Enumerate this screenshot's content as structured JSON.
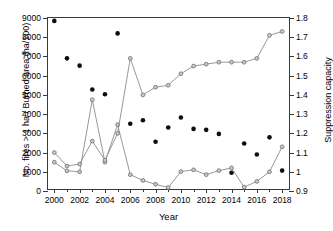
{
  "chart_data": {
    "type": "scatter",
    "title": "",
    "xlabel": "Year",
    "ylabel": "No. fires > 1 ha / Burned area (ha/100)",
    "ylabel_right": "Suppression capacity",
    "xlim": [
      1999.5,
      2018.7
    ],
    "ylim": [
      0,
      9000
    ],
    "ylim_right": [
      0.9,
      1.8
    ],
    "grid": false,
    "legend": "none",
    "x": [
      2000,
      2001,
      2002,
      2003,
      2004,
      2005,
      2006,
      2007,
      2008,
      2009,
      2010,
      2011,
      2012,
      2013,
      2014,
      2015,
      2016,
      2017,
      2018
    ],
    "xticks": [
      2000,
      2002,
      2004,
      2006,
      2008,
      2010,
      2012,
      2014,
      2016,
      2018
    ],
    "xticks_minor": [
      2001,
      2003,
      2005,
      2007,
      2009,
      2011,
      2013,
      2015,
      2017
    ],
    "yticks_left": [
      0,
      1000,
      2000,
      3000,
      4000,
      5000,
      6000,
      7000,
      8000,
      9000
    ],
    "yticks_right": [
      0.9,
      1,
      1.1,
      1.2,
      1.3,
      1.4,
      1.5,
      1.6,
      1.7,
      1.8
    ],
    "series": [
      {
        "name": "Burned area (ha/100)",
        "axis": "left",
        "style": "markers",
        "marker": "filled-circle",
        "color": "#0d0d0d",
        "values": [
          8850,
          6900,
          6520,
          5280,
          5030,
          8200,
          3500,
          3680,
          2560,
          3300,
          3820,
          3230,
          3180,
          2970,
          950,
          2470,
          1900,
          2790,
          1060
        ]
      },
      {
        "name": "No. fires > 1 ha",
        "axis": "left",
        "style": "line-markers",
        "marker": "open-circle",
        "color": "#8c8c8c",
        "values": [
          1500,
          1050,
          1000,
          4750,
          1500,
          3450,
          850,
          550,
          350,
          180,
          1010,
          1100,
          850,
          1060,
          1200,
          200,
          500,
          1000,
          2300
        ]
      },
      {
        "name": "Suppression capacity",
        "axis": "right",
        "style": "line-markers",
        "marker": "open-circle",
        "color": "#8c8c8c",
        "values": [
          1.1,
          1.03,
          1.04,
          1.16,
          1.06,
          1.2,
          1.59,
          1.4,
          1.44,
          1.45,
          1.51,
          1.55,
          1.56,
          1.57,
          1.57,
          1.57,
          1.59,
          1.71,
          1.73
        ]
      }
    ]
  }
}
